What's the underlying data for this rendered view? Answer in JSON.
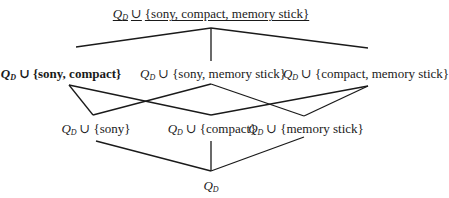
{
  "diagram": {
    "type": "subset-lattice",
    "base_symbol": "Q",
    "base_subscript": "D",
    "union_symbol": "∪",
    "nodes": [
      {
        "id": "top",
        "label_set": "{sony, compact, memory stick}",
        "level": 3,
        "x": 211,
        "y": 6,
        "style": "underlined"
      },
      {
        "id": "sony-compact",
        "label_set": "{sony, compact}",
        "level": 2,
        "x": 62,
        "y": 66,
        "style": "bold"
      },
      {
        "id": "sony-memory",
        "label_set": "{sony, memory stick}",
        "level": 2,
        "x": 212,
        "y": 66,
        "style": "normal"
      },
      {
        "id": "compact-memory",
        "label_set": "{compact, memory stick}",
        "level": 2,
        "x": 366,
        "y": 66,
        "style": "normal"
      },
      {
        "id": "sony",
        "label_set": "{sony}",
        "level": 1,
        "x": 96,
        "y": 121,
        "style": "normal"
      },
      {
        "id": "compact",
        "label_set": "{compact}",
        "level": 1,
        "x": 212,
        "y": 121,
        "style": "normal"
      },
      {
        "id": "memory",
        "label_set": "{memory stick}",
        "level": 1,
        "x": 305,
        "y": 121,
        "style": "normal"
      },
      {
        "id": "bottom",
        "label_set": "",
        "level": 0,
        "x": 211,
        "y": 178,
        "style": "normal"
      }
    ],
    "edges": [
      {
        "from": "top",
        "to": "sony-compact",
        "x1": 211,
        "y1": 28,
        "x2": 76,
        "y2": 47
      },
      {
        "from": "top",
        "to": "sony-memory",
        "x1": 211,
        "y1": 28,
        "x2": 211,
        "y2": 61
      },
      {
        "from": "top",
        "to": "compact-memory",
        "x1": 211,
        "y1": 28,
        "x2": 368,
        "y2": 48
      },
      {
        "from": "sony-compact",
        "to": "sony",
        "x1": 69,
        "y1": 85,
        "x2": 93,
        "y2": 115
      },
      {
        "from": "sony-compact",
        "to": "compact",
        "x1": 69,
        "y1": 85,
        "x2": 211,
        "y2": 115
      },
      {
        "from": "sony-memory",
        "to": "sony",
        "x1": 211,
        "y1": 84,
        "x2": 93,
        "y2": 115
      },
      {
        "from": "sony-memory",
        "to": "memory",
        "x1": 211,
        "y1": 84,
        "x2": 304,
        "y2": 116
      },
      {
        "from": "compact-memory",
        "to": "compact",
        "x1": 368,
        "y1": 86,
        "x2": 211,
        "y2": 115
      },
      {
        "from": "compact-memory",
        "to": "memory",
        "x1": 368,
        "y1": 86,
        "x2": 304,
        "y2": 116
      },
      {
        "from": "sony",
        "to": "bottom",
        "x1": 96,
        "y1": 141,
        "x2": 211,
        "y2": 171
      },
      {
        "from": "compact",
        "to": "bottom",
        "x1": 211,
        "y1": 141,
        "x2": 211,
        "y2": 171
      },
      {
        "from": "memory",
        "to": "bottom",
        "x1": 304,
        "y1": 137,
        "x2": 211,
        "y2": 171
      }
    ]
  },
  "labels": {
    "q": "Q",
    "sub": "D",
    "union": "∪",
    "top_set": "{sony, compact, memory stick}",
    "sony_compact_set": "{sony, compact}",
    "sony_memory_set": "{sony, memory stick}",
    "compact_memory_set": "{compact, memory stick}",
    "sony_set": "{sony}",
    "compact_set": "{compact}",
    "memory_set": "{memory stick}"
  }
}
